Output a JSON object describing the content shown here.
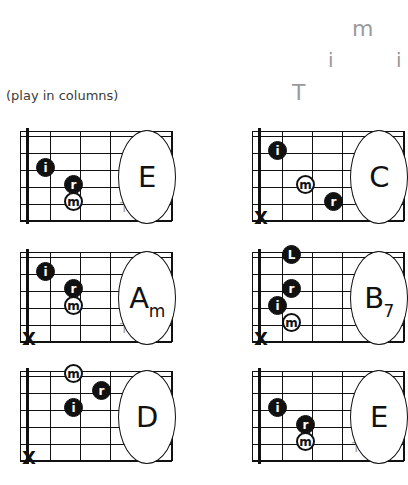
{
  "caption": "(play in columns)",
  "fingering_pattern": {
    "label": "thumb-index-middle-index picking pattern",
    "letters": [
      {
        "text": "m",
        "x": 352,
        "y": 18,
        "size": 22
      },
      {
        "text": "i",
        "x": 328,
        "y": 50,
        "size": 20
      },
      {
        "text": "i",
        "x": 396,
        "y": 50,
        "size": 20
      },
      {
        "text": "T",
        "x": 292,
        "y": 82,
        "size": 22
      }
    ]
  },
  "legend": {
    "T": "thumb",
    "i": "index",
    "m": "middle",
    "r": "ring",
    "L": "little"
  },
  "colors": {
    "ink": "#111111",
    "gray": "#9a9a9a",
    "thumb_gray": "#a8a8a8",
    "background": "#ffffff"
  },
  "board": {
    "strings": 6,
    "frets": 5,
    "string_ys": [
      5,
      22,
      39,
      56,
      73,
      90
    ],
    "fret_xs": [
      14,
      44,
      74,
      104,
      134,
      166
    ]
  },
  "chords": [
    {
      "name": "E",
      "sub": "",
      "row": 0,
      "col": 0,
      "mute": false,
      "thumb": {
        "x": 100,
        "y": 72
      },
      "dots": [
        {
          "finger": "i",
          "style": "filled",
          "x": 16,
          "y": 31
        },
        {
          "finger": "r",
          "style": "filled",
          "x": 44,
          "y": 48
        },
        {
          "finger": "m",
          "style": "open",
          "x": 44,
          "y": 65
        }
      ]
    },
    {
      "name": "C",
      "sub": "",
      "row": 0,
      "col": 1,
      "mute": true,
      "thumb": {
        "x": 100,
        "y": 65
      },
      "dots": [
        {
          "finger": "i",
          "style": "filled",
          "x": 16,
          "y": 14
        },
        {
          "finger": "m",
          "style": "open",
          "x": 44,
          "y": 48
        },
        {
          "finger": "r",
          "style": "filled",
          "x": 72,
          "y": 65
        }
      ]
    },
    {
      "name": "A",
      "sub": "m",
      "row": 1,
      "col": 0,
      "mute": true,
      "thumb": {
        "x": 100,
        "y": 72
      },
      "dots": [
        {
          "finger": "i",
          "style": "filled",
          "x": 16,
          "y": 14
        },
        {
          "finger": "r",
          "style": "filled",
          "x": 44,
          "y": 31
        },
        {
          "finger": "m",
          "style": "open",
          "x": 44,
          "y": 48
        }
      ]
    },
    {
      "name": "B",
      "sub": "7",
      "row": 1,
      "col": 1,
      "mute": true,
      "thumb": {
        "x": 100,
        "y": 65
      },
      "dots": [
        {
          "finger": "L",
          "style": "filled",
          "x": 30,
          "y": -3
        },
        {
          "finger": "r",
          "style": "filled",
          "x": 30,
          "y": 31
        },
        {
          "finger": "i",
          "style": "filled",
          "x": 16,
          "y": 48
        },
        {
          "finger": "m",
          "style": "open",
          "x": 30,
          "y": 65
        }
      ]
    },
    {
      "name": "D",
      "sub": "",
      "row": 2,
      "col": 0,
      "mute": true,
      "thumb": {
        "x": 100,
        "y": 48
      },
      "dots": [
        {
          "finger": "m",
          "style": "open",
          "x": 44,
          "y": -3
        },
        {
          "finger": "r",
          "style": "filled",
          "x": 72,
          "y": 14
        },
        {
          "finger": "i",
          "style": "filled",
          "x": 44,
          "y": 31
        }
      ]
    },
    {
      "name": "E",
      "sub": "",
      "row": 2,
      "col": 1,
      "mute": false,
      "thumb": {
        "x": 100,
        "y": 72
      },
      "dots": [
        {
          "finger": "i",
          "style": "filled",
          "x": 16,
          "y": 31
        },
        {
          "finger": "r",
          "style": "filled",
          "x": 44,
          "y": 48
        },
        {
          "finger": "m",
          "style": "open",
          "x": 44,
          "y": 65
        }
      ]
    }
  ]
}
